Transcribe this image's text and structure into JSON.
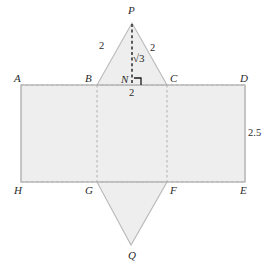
{
  "figure": {
    "colors": {
      "fill": "#eeeeee",
      "stroke": "#b9b9b9",
      "dashed": "#b0b0b0",
      "altitude": "#1a1a1a",
      "text": "#2b2b2b",
      "background": "#ffffff"
    },
    "vertex_labels": [
      {
        "id": "P",
        "text": "P",
        "x": 128,
        "y": 5
      },
      {
        "id": "A",
        "text": "A",
        "x": 14,
        "y": 73
      },
      {
        "id": "B",
        "text": "B",
        "x": 85,
        "y": 73
      },
      {
        "id": "N",
        "text": "N",
        "x": 121,
        "y": 74
      },
      {
        "id": "C",
        "text": "C",
        "x": 170,
        "y": 73
      },
      {
        "id": "D",
        "text": "D",
        "x": 240,
        "y": 73
      },
      {
        "id": "H",
        "text": "H",
        "x": 14,
        "y": 185
      },
      {
        "id": "G",
        "text": "G",
        "x": 85,
        "y": 185
      },
      {
        "id": "F",
        "text": "F",
        "x": 170,
        "y": 185
      },
      {
        "id": "E",
        "text": "E",
        "x": 240,
        "y": 185
      },
      {
        "id": "Q",
        "text": "Q",
        "x": 128,
        "y": 250
      }
    ],
    "measure_labels": [
      {
        "id": "left-slant",
        "text": "2",
        "x": 99,
        "y": 41
      },
      {
        "id": "right-slant",
        "text": "2",
        "x": 150,
        "y": 43
      },
      {
        "id": "base-half",
        "text": "2",
        "x": 129,
        "y": 88
      },
      {
        "id": "prism-height",
        "text": "2.5",
        "x": 248,
        "y": 128
      }
    ],
    "radical_label": {
      "id": "altitude",
      "text": "√3",
      "x": 133,
      "y": 53
    },
    "geometry": {
      "rect_left": 21,
      "rect_right": 245,
      "rect_top": 85,
      "rect_bottom": 182,
      "fold_left_x": 97,
      "fold_right_x": 167,
      "apex_top": {
        "x": 132,
        "y": 23
      },
      "apex_bottom": {
        "x": 131,
        "y": 245
      },
      "foot_n": {
        "x": 132,
        "y": 85
      }
    }
  }
}
